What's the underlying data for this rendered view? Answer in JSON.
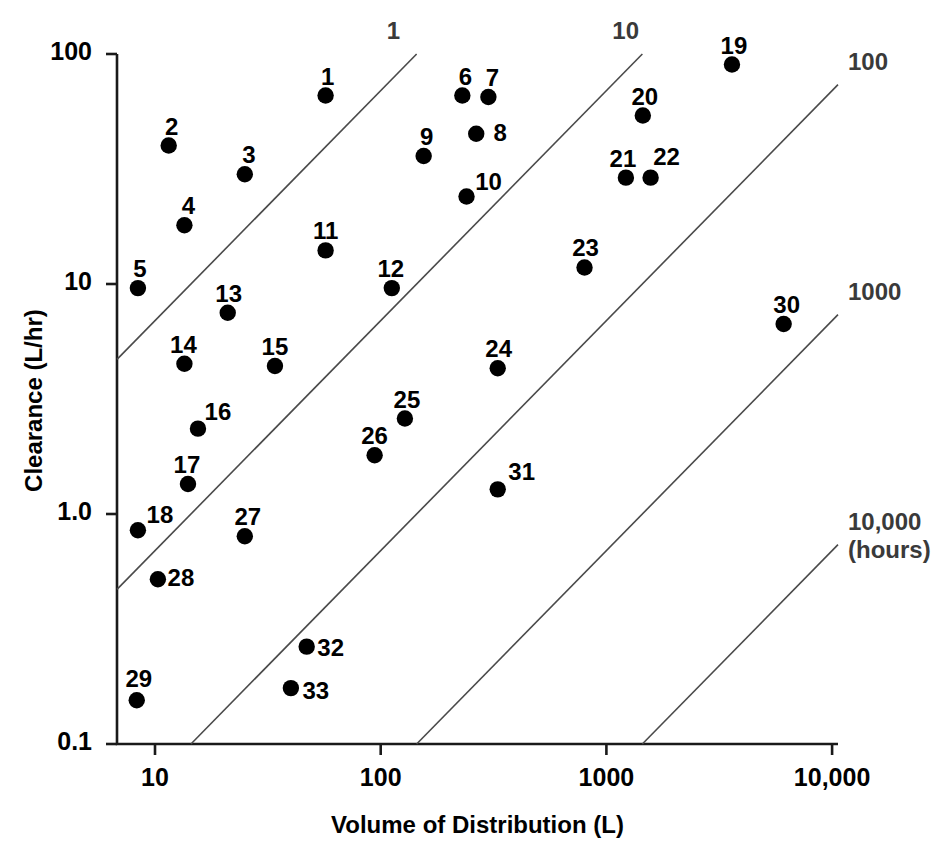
{
  "chart_data": {
    "type": "scatter",
    "title": "",
    "xlabel": "Volume of Distribution (L)",
    "ylabel": "Clearance (L/hr)",
    "xscale": "log",
    "yscale": "log",
    "xlim": [
      7.0,
      13800
    ],
    "ylim": [
      0.1,
      100
    ],
    "xticks": [
      10,
      100,
      1000,
      10000
    ],
    "xticklabels": [
      "10",
      "100",
      "1000",
      "10,000"
    ],
    "yticks": [
      0.1,
      1.0,
      10,
      100
    ],
    "yticklabels": [
      "0.1",
      "1.0",
      "10",
      "100"
    ],
    "grid": false,
    "legend": null,
    "annotations": {
      "iso_line_description": "Diagonal lines are constant half-life iso-lines, labelled in hours",
      "iso_unit_label": "(hours)"
    },
    "iso_lines": [
      {
        "label": "1",
        "half_life_hours": 1
      },
      {
        "label": "10",
        "half_life_hours": 10
      },
      {
        "label": "100",
        "half_life_hours": 100
      },
      {
        "label": "1000",
        "half_life_hours": 1000
      },
      {
        "label": "10,000",
        "half_life_hours": 10000,
        "sublabel": "(hours)"
      }
    ],
    "point_label_field": "label",
    "points": [
      {
        "label": "1",
        "x": 57,
        "y": 66,
        "lx": -4,
        "ly": -30
      },
      {
        "label": "2",
        "x": 11.5,
        "y": 40,
        "lx": -3,
        "ly": -30
      },
      {
        "label": "3",
        "x": 25,
        "y": 30,
        "lx": -2,
        "ly": -30
      },
      {
        "label": "4",
        "x": 13.5,
        "y": 18,
        "lx": -2,
        "ly": -30
      },
      {
        "label": "5",
        "x": 8.4,
        "y": 9.6,
        "lx": -4,
        "ly": -30
      },
      {
        "label": "6",
        "x": 230,
        "y": 66,
        "lx": -3,
        "ly": -30
      },
      {
        "label": "7",
        "x": 300,
        "y": 65,
        "lx": -2,
        "ly": -30
      },
      {
        "label": "8",
        "x": 265,
        "y": 45,
        "lx": 18,
        "ly": -12
      },
      {
        "label": "9",
        "x": 155,
        "y": 36,
        "lx": -3,
        "ly": -30
      },
      {
        "label": "10",
        "x": 240,
        "y": 24,
        "lx": 16,
        "ly": -26
      },
      {
        "label": "11",
        "x": 57,
        "y": 14,
        "lx": -6,
        "ly": -30
      },
      {
        "label": "12",
        "x": 112,
        "y": 9.6,
        "lx": -7,
        "ly": -30
      },
      {
        "label": "13",
        "x": 21,
        "y": 7.5,
        "lx": -5,
        "ly": -30
      },
      {
        "label": "14",
        "x": 13.5,
        "y": 4.5,
        "lx": -7,
        "ly": -30
      },
      {
        "label": "15",
        "x": 34,
        "y": 4.4,
        "lx": -6,
        "ly": -30
      },
      {
        "label": "16",
        "x": 15.5,
        "y": 2.35,
        "lx": 14,
        "ly": -28
      },
      {
        "label": "17",
        "x": 14,
        "y": 1.35,
        "lx": -7,
        "ly": -30
      },
      {
        "label": "18",
        "x": 8.4,
        "y": 0.85,
        "lx": 16,
        "ly": -26
      },
      {
        "label": "19",
        "x": 3600,
        "y": 90,
        "lx": -4,
        "ly": -30
      },
      {
        "label": "20",
        "x": 1450,
        "y": 54,
        "lx": -4,
        "ly": -30
      },
      {
        "label": "21",
        "x": 1220,
        "y": 29,
        "lx": -9,
        "ly": -30
      },
      {
        "label": "22",
        "x": 1570,
        "y": 29,
        "lx": 10,
        "ly": -32
      },
      {
        "label": "23",
        "x": 800,
        "y": 11.8,
        "lx": -5,
        "ly": -30
      },
      {
        "label": "24",
        "x": 330,
        "y": 4.3,
        "lx": -5,
        "ly": -30
      },
      {
        "label": "25",
        "x": 128,
        "y": 2.6,
        "lx": -4,
        "ly": -30
      },
      {
        "label": "26",
        "x": 94,
        "y": 1.8,
        "lx": -6,
        "ly": -30
      },
      {
        "label": "27",
        "x": 25,
        "y": 0.8,
        "lx": -3,
        "ly": -30
      },
      {
        "label": "28",
        "x": 10.3,
        "y": 0.52,
        "lx": 17,
        "ly": -12
      },
      {
        "label": "29",
        "x": 8.3,
        "y": 0.155,
        "lx": -4,
        "ly": -32
      },
      {
        "label": "30",
        "x": 6100,
        "y": 6.7,
        "lx": -3,
        "ly": -30
      },
      {
        "label": "31",
        "x": 330,
        "y": 1.28,
        "lx": 18,
        "ly": -28
      },
      {
        "label": "32",
        "x": 47,
        "y": 0.265,
        "lx": 18,
        "ly": -10
      },
      {
        "label": "33",
        "x": 40,
        "y": 0.175,
        "lx": 19,
        "ly": -8
      }
    ]
  },
  "axes": {
    "x_title": "Volume of Distribution (L)",
    "y_title": "Clearance (L/hr)"
  }
}
